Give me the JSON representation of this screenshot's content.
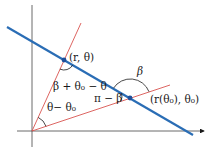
{
  "diagram": {
    "colors": {
      "axes": "#333333",
      "line": "#2a6db5",
      "rays": "#d9534f",
      "point": "#1f4f99",
      "arc": "#1a1a1a"
    },
    "points": {
      "p1": {
        "label": "(r, θ)"
      },
      "p0": {
        "label": "(r(θ₀), θ₀)"
      }
    },
    "angles": {
      "outer": {
        "label": "β"
      },
      "theta_diff": {
        "label": "θ− θ₀"
      },
      "top_angle": {
        "label": "β + θ₀ − θ"
      },
      "pi_minus_beta": {
        "label": "π − β"
      }
    }
  }
}
